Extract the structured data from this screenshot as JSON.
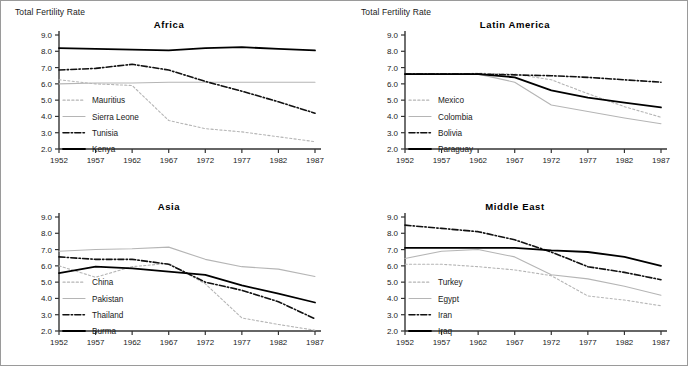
{
  "figure": {
    "axis_label": "Total Fertility Rate",
    "border_color": "#9a9a9a",
    "background": "#ffffff"
  },
  "styles": {
    "dotted_gray": "#b5b5b5",
    "solid_gray": "#b5b5b5",
    "dashdot_black": "#111111",
    "solid_black": "#000000"
  },
  "chart_data": [
    {
      "type": "line",
      "title": "Africa",
      "xlabel": "",
      "ylabel": "Total Fertility Rate",
      "x": [
        1952,
        1957,
        1962,
        1967,
        1972,
        1977,
        1982,
        1987
      ],
      "xlim": [
        1952,
        1987
      ],
      "ylim": [
        2.0,
        9.0
      ],
      "yticks": [
        "2.0",
        "3.0",
        "4.0",
        "5.0",
        "6.0",
        "7.0",
        "8.0",
        "9.0"
      ],
      "xticks": [
        "1952",
        "1957",
        "1962",
        "1967",
        "1972",
        "1977",
        "1982",
        "1987"
      ],
      "grid": false,
      "legend_position": "lower-left",
      "series": [
        {
          "name": "Mauritius",
          "style": "dotted_gray",
          "values": [
            6.25,
            6.0,
            5.9,
            3.75,
            3.25,
            3.05,
            2.75,
            2.45
          ]
        },
        {
          "name": "Sierra Leone",
          "style": "solid_gray",
          "values": [
            6.0,
            6.05,
            6.05,
            6.1,
            6.1,
            6.1,
            6.1,
            6.1
          ]
        },
        {
          "name": "Tunisia",
          "style": "dashdot_black",
          "values": [
            6.85,
            6.95,
            7.2,
            6.85,
            6.15,
            5.55,
            4.9,
            4.2
          ]
        },
        {
          "name": "Kenya",
          "style": "solid_black",
          "values": [
            8.2,
            8.15,
            8.1,
            8.05,
            8.2,
            8.25,
            8.15,
            8.05
          ]
        }
      ]
    },
    {
      "type": "line",
      "title": "Latin America",
      "xlabel": "",
      "ylabel": "Total Fertility Rate",
      "x": [
        1952,
        1957,
        1962,
        1967,
        1972,
        1977,
        1982,
        1987
      ],
      "xlim": [
        1952,
        1987
      ],
      "ylim": [
        2.0,
        9.0
      ],
      "yticks": [
        "2.0",
        "3.0",
        "4.0",
        "5.0",
        "6.0",
        "7.0",
        "8.0",
        "9.0"
      ],
      "xticks": [
        "1952",
        "1957",
        "1962",
        "1967",
        "1972",
        "1977",
        "1982",
        "1987"
      ],
      "grid": false,
      "legend_position": "lower-left",
      "series": [
        {
          "name": "Mexico",
          "style": "dotted_gray",
          "values": [
            6.6,
            6.6,
            6.65,
            6.6,
            6.25,
            5.4,
            4.6,
            3.95
          ]
        },
        {
          "name": "Colombia",
          "style": "solid_gray",
          "values": [
            6.6,
            6.6,
            6.6,
            6.1,
            4.7,
            4.3,
            3.9,
            3.55
          ]
        },
        {
          "name": "Bolivia",
          "style": "dashdot_black",
          "values": [
            6.6,
            6.6,
            6.6,
            6.55,
            6.5,
            6.4,
            6.25,
            6.1
          ]
        },
        {
          "name": "Paraguay",
          "style": "solid_black",
          "values": [
            6.6,
            6.6,
            6.6,
            6.4,
            5.6,
            5.15,
            4.85,
            4.55
          ]
        }
      ]
    },
    {
      "type": "line",
      "title": "Asia",
      "xlabel": "",
      "ylabel": "Total Fertility Rate",
      "x": [
        1952,
        1957,
        1962,
        1967,
        1972,
        1977,
        1982,
        1987
      ],
      "xlim": [
        1952,
        1987
      ],
      "ylim": [
        2.0,
        9.0
      ],
      "yticks": [
        "2.0",
        "3.0",
        "4.0",
        "5.0",
        "6.0",
        "7.0",
        "8.0",
        "9.0"
      ],
      "xticks": [
        "1952",
        "1957",
        "1962",
        "1967",
        "1972",
        "1977",
        "1982",
        "1987"
      ],
      "grid": false,
      "legend_position": "lower-left",
      "series": [
        {
          "name": "China",
          "style": "dotted_gray",
          "values": [
            6.0,
            5.3,
            5.95,
            6.15,
            4.9,
            2.8,
            2.4,
            2.05
          ]
        },
        {
          "name": "Pakistan",
          "style": "solid_gray",
          "values": [
            6.9,
            7.0,
            7.05,
            7.15,
            6.4,
            5.95,
            5.8,
            5.35
          ]
        },
        {
          "name": "Thailand",
          "style": "dashdot_black",
          "values": [
            6.55,
            6.4,
            6.4,
            6.1,
            5.0,
            4.5,
            3.8,
            2.75
          ]
        },
        {
          "name": "Burma",
          "style": "solid_black",
          "values": [
            5.55,
            5.95,
            5.85,
            5.65,
            5.45,
            4.8,
            4.3,
            3.75
          ]
        }
      ]
    },
    {
      "type": "line",
      "title": "Middle East",
      "xlabel": "",
      "ylabel": "Total Fertility Rate",
      "x": [
        1952,
        1957,
        1962,
        1967,
        1972,
        1977,
        1982,
        1987
      ],
      "xlim": [
        1952,
        1987
      ],
      "ylim": [
        2.0,
        9.0
      ],
      "yticks": [
        "2.0",
        "3.0",
        "4.0",
        "5.0",
        "6.0",
        "7.0",
        "8.0",
        "9.0"
      ],
      "xticks": [
        "1952",
        "1957",
        "1962",
        "1967",
        "1972",
        "1977",
        "1982",
        "1987"
      ],
      "grid": false,
      "legend_position": "lower-left",
      "series": [
        {
          "name": "Turkey",
          "style": "dotted_gray",
          "values": [
            6.1,
            6.1,
            5.95,
            5.75,
            5.4,
            4.15,
            3.9,
            3.55
          ]
        },
        {
          "name": "Egypt",
          "style": "solid_gray",
          "values": [
            6.45,
            6.9,
            7.0,
            6.55,
            5.45,
            5.2,
            4.75,
            4.2
          ]
        },
        {
          "name": "Iran",
          "style": "dashdot_black",
          "values": [
            8.5,
            8.3,
            8.1,
            7.6,
            6.85,
            5.95,
            5.6,
            5.15
          ]
        },
        {
          "name": "Iraq",
          "style": "solid_black",
          "values": [
            7.1,
            7.1,
            7.1,
            7.1,
            6.95,
            6.85,
            6.55,
            6.0
          ]
        }
      ]
    }
  ]
}
